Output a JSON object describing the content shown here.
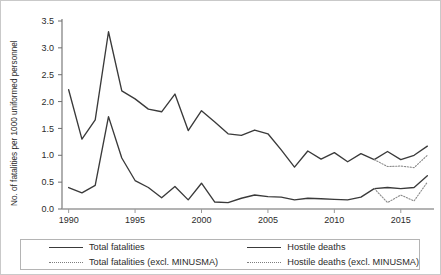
{
  "chart_data": {
    "type": "line",
    "title": "",
    "xlabel": "",
    "ylabel": "No. of fatalities per 1000 uniformed personnel",
    "xlim": [
      1989.5,
      2017.5
    ],
    "ylim": [
      0.0,
      3.5
    ],
    "yticks": [
      "0.0",
      "0.5",
      "1.0",
      "1.5",
      "2.0",
      "2.5",
      "3.0",
      "3.5"
    ],
    "ytick_values": [
      0.0,
      0.5,
      1.0,
      1.5,
      2.0,
      2.5,
      3.0,
      3.5
    ],
    "xticks": [
      "1990",
      "1995",
      "2000",
      "2005",
      "2010",
      "2015"
    ],
    "xtick_values": [
      1990,
      1995,
      2000,
      2005,
      2010,
      2015
    ],
    "grid": false,
    "legend_position": "bottom",
    "x": [
      1990,
      1991,
      1992,
      1993,
      1994,
      1995,
      1996,
      1997,
      1998,
      1999,
      2000,
      2001,
      2002,
      2003,
      2004,
      2005,
      2006,
      2007,
      2008,
      2009,
      2010,
      2011,
      2012,
      2013,
      2014,
      2015,
      2016,
      2017
    ],
    "series": [
      {
        "name": "Total fatalities",
        "style": "solid",
        "color": "#3a3a3a",
        "values": [
          2.22,
          1.3,
          1.66,
          3.3,
          2.2,
          2.05,
          1.86,
          1.81,
          2.14,
          1.46,
          1.83,
          1.62,
          1.4,
          1.37,
          1.47,
          1.4,
          1.1,
          0.78,
          1.08,
          0.93,
          1.05,
          0.88,
          1.03,
          0.92,
          1.07,
          0.92,
          1.0,
          1.17
        ]
      },
      {
        "name": "Total fatalities (excl. MINUSMA)",
        "style": "dotted",
        "color": "#8a8a8a",
        "values": [
          null,
          null,
          null,
          null,
          null,
          null,
          null,
          null,
          null,
          null,
          null,
          null,
          null,
          null,
          null,
          null,
          null,
          null,
          null,
          null,
          null,
          null,
          null,
          0.92,
          0.79,
          0.8,
          0.77,
          1.0
        ]
      },
      {
        "name": "Hostile deaths",
        "style": "solid",
        "color": "#3a3a3a",
        "values": [
          0.4,
          0.3,
          0.44,
          1.72,
          0.95,
          0.53,
          0.4,
          0.21,
          0.42,
          0.17,
          0.48,
          0.13,
          0.12,
          0.2,
          0.26,
          0.23,
          0.22,
          0.17,
          0.2,
          0.19,
          0.18,
          0.17,
          0.22,
          0.38,
          0.4,
          0.38,
          0.4,
          0.62
        ]
      },
      {
        "name": "Hostile deaths (excl. MINUSMA)",
        "style": "dotted",
        "color": "#8a8a8a",
        "values": [
          null,
          null,
          null,
          null,
          null,
          null,
          null,
          null,
          null,
          null,
          null,
          null,
          null,
          null,
          null,
          null,
          null,
          null,
          null,
          null,
          null,
          null,
          null,
          0.38,
          0.12,
          0.26,
          0.15,
          0.5
        ]
      }
    ]
  },
  "legend": {
    "entries": [
      {
        "label": "Total fatalities",
        "style": "solid"
      },
      {
        "label": "Hostile deaths",
        "style": "solid"
      },
      {
        "label": "Total fatalities (excl. MINUSMA)",
        "style": "dotted"
      },
      {
        "label": "Hostile deaths (excl. MINUSMA)",
        "style": "dotted"
      }
    ]
  }
}
